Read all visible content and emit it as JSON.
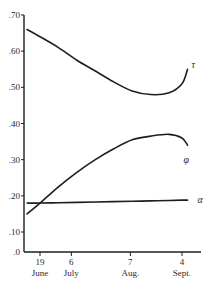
{
  "chart_data": {
    "type": "line",
    "title": "",
    "xlabel": "",
    "ylabel": "",
    "ylim": [
      0,
      0.7
    ],
    "grid": false,
    "legend": "inline labels at right end of each curve",
    "y_ticks": [
      {
        "value": 0.0,
        "label": ".0"
      },
      {
        "value": 0.1,
        "label": ".10"
      },
      {
        "value": 0.2,
        "label": ".20"
      },
      {
        "value": 0.3,
        "label": ".30"
      },
      {
        "value": 0.4,
        "label": ".40"
      },
      {
        "value": 0.5,
        "label": ".50"
      },
      {
        "value": 0.6,
        "label": ".60"
      },
      {
        "value": 0.7,
        "label": ".70"
      }
    ],
    "x_ticks": [
      {
        "day": 0,
        "day_label": "19",
        "month_label": "June"
      },
      {
        "day": 17,
        "day_label": "6",
        "month_label": "July"
      },
      {
        "day": 49,
        "day_label": "7",
        "month_label": "Aug."
      },
      {
        "day": 77,
        "day_label": "4",
        "month_label": "Sept."
      }
    ],
    "x": [
      -7,
      0,
      10,
      20,
      30,
      40,
      50,
      60,
      70,
      77,
      80
    ],
    "series": [
      {
        "name": "τ",
        "label": "τ",
        "values": [
          0.66,
          0.64,
          0.61,
          0.575,
          0.545,
          0.515,
          0.49,
          0.48,
          0.485,
          0.51,
          0.55
        ]
      },
      {
        "name": "φ",
        "label": "φ",
        "values": [
          0.15,
          0.18,
          0.225,
          0.265,
          0.3,
          0.33,
          0.355,
          0.365,
          0.37,
          0.36,
          0.34
        ]
      },
      {
        "name": "α",
        "label": "α",
        "values": [
          0.18,
          0.18,
          0.181,
          0.182,
          0.183,
          0.184,
          0.185,
          0.186,
          0.187,
          0.188,
          0.188
        ]
      }
    ]
  },
  "colors": {
    "line": "#1e1e1e",
    "axis": "#1e1e1e",
    "background": "#ffffff"
  }
}
